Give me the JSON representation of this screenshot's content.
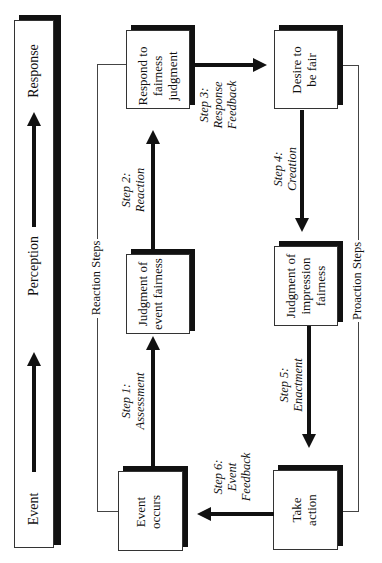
{
  "legend": {
    "labels": [
      "Response",
      "Perception",
      "Event"
    ]
  },
  "brackets": {
    "reaction": "Reaction Steps",
    "proaction": "Proaction Steps"
  },
  "boxes": {
    "respond": "Respond to fairness judgment",
    "judgment_event": "Judgment of event fairness",
    "event_occurs": "Event occurs",
    "desire": "Desire to be fair",
    "judgment_impression": "Judgment of impression fairness",
    "take_action": "Take action"
  },
  "steps": {
    "step1": {
      "num": "Step 1:",
      "name": "Assessment"
    },
    "step2": {
      "num": "Step 2:",
      "name": "Reaction"
    },
    "step3": {
      "num": "Step 3:",
      "name1": "Response",
      "name2": "Feedback"
    },
    "step4": {
      "num": "Step 4:",
      "name": "Creation"
    },
    "step5": {
      "num": "Step 5:",
      "name": "Enactment"
    },
    "step6": {
      "num": "Step 6:",
      "name1": "Event",
      "name2": "Feedback"
    }
  },
  "colors": {
    "ink": "#111111",
    "background": "#ffffff"
  }
}
